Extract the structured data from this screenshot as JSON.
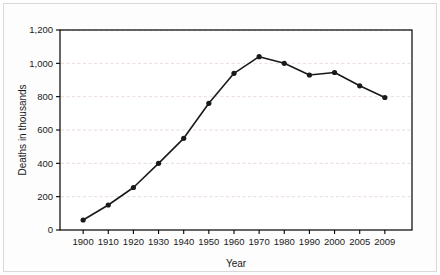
{
  "chart_data": {
    "type": "line",
    "title": "",
    "xlabel": "Year",
    "ylabel": "Deaths in thousands",
    "categories": [
      "1900",
      "1910",
      "1920",
      "1930",
      "1940",
      "1950",
      "1960",
      "1970",
      "1980",
      "1990",
      "2000",
      "2005",
      "2009"
    ],
    "values": [
      60,
      150,
      255,
      400,
      550,
      760,
      940,
      1040,
      1000,
      930,
      945,
      865,
      795
    ],
    "series": [
      {
        "name": "Deaths",
        "values": [
          60,
          150,
          255,
          400,
          550,
          760,
          940,
          1040,
          1000,
          930,
          945,
          865,
          795
        ]
      }
    ],
    "ylim": [
      0,
      1200
    ],
    "yticks": [
      0,
      200,
      400,
      600,
      800,
      1000,
      1200
    ],
    "ytick_labels": [
      "0",
      "200",
      "400",
      "600",
      "800",
      "1,000",
      "1,200"
    ],
    "xtick_labels": [
      "1900",
      "1910",
      "1920",
      "1930",
      "1940",
      "1950",
      "1960",
      "1970",
      "1980",
      "1990",
      "2000",
      "2005",
      "2009"
    ],
    "grid": "horizontal-dashed",
    "legend": "none",
    "marker": "filled-circle",
    "line_color": "#1a1a1a",
    "marker_color": "#1a1a1a",
    "grid_color": "#e8d6d6",
    "axis_color": "#000000",
    "plot_background": "#ffffff"
  }
}
